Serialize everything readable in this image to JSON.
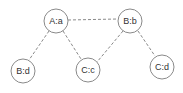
{
  "diagram": {
    "type": "graph",
    "nodes": [
      {
        "id": "A_a",
        "label": "A:a",
        "cx": 56,
        "cy": 21,
        "r": 12
      },
      {
        "id": "B_b",
        "label": "B:b",
        "cx": 130,
        "cy": 21,
        "r": 12
      },
      {
        "id": "B_d",
        "label": "B:d",
        "cx": 23,
        "cy": 71,
        "r": 12
      },
      {
        "id": "C_c",
        "label": "C:c",
        "cx": 88,
        "cy": 70,
        "r": 12
      },
      {
        "id": "C_d",
        "label": "C:d",
        "cx": 162,
        "cy": 67,
        "r": 12
      }
    ],
    "edges": [
      {
        "from": "A_a",
        "to": "B_b",
        "style": "dashed"
      },
      {
        "from": "A_a",
        "to": "B_d",
        "style": "dashed"
      },
      {
        "from": "A_a",
        "to": "C_c",
        "style": "dashed"
      },
      {
        "from": "B_b",
        "to": "C_c",
        "style": "dashed"
      },
      {
        "from": "B_b",
        "to": "C_d",
        "style": "dashed"
      }
    ],
    "colors": {
      "stroke": "#8a8a8a",
      "label": "#333333",
      "background": "#ffffff"
    }
  }
}
